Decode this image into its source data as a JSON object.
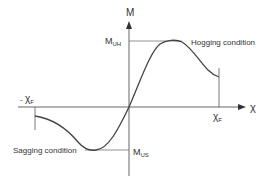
{
  "diagram": {
    "type": "moment-curvature",
    "axes": {
      "y_label": "M",
      "x_label": "χ"
    },
    "labels": {
      "m_uh_main": "M",
      "m_uh_sub": "UH",
      "m_us_main": "M",
      "m_us_sub": "US",
      "chi_f_pos_main": "χ",
      "chi_f_pos_sub": "F",
      "chi_f_neg_prefix": "- ",
      "chi_f_neg_main": "χ",
      "chi_f_neg_sub": "F",
      "hogging": "Hogging condition",
      "sagging": "Sagging condition"
    },
    "colors": {
      "line": "#444444",
      "text": "#333333"
    }
  }
}
